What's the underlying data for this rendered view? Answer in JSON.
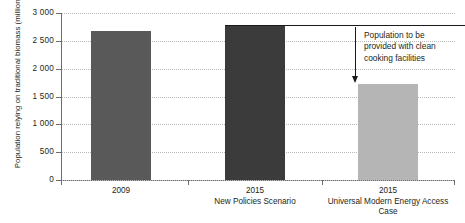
{
  "chart_data": {
    "type": "bar",
    "title": "",
    "xlabel": "",
    "ylabel": "Population relying on traditional biomass (million)",
    "ylim": [
      0,
      3000
    ],
    "grid": true,
    "legend": "none",
    "categories": [
      {
        "main": "2009",
        "sub": ""
      },
      {
        "main": "2015",
        "sub": "New Policies Scenario"
      },
      {
        "main": "2015",
        "sub": "Universal Modern Energy Access Case"
      }
    ],
    "values": [
      2670,
      2760,
      1720
    ],
    "bar_colors": [
      "#595959",
      "#3b3b3b",
      "#b5b5b5"
    ],
    "yticks": [
      "0",
      "500",
      "1 000",
      "1 500",
      "2 000",
      "2 500",
      "3 000"
    ],
    "ytick_values": [
      0,
      500,
      1000,
      1500,
      2000,
      2500,
      3000
    ],
    "annotations": [
      {
        "text_lines": [
          "Population to be",
          "provided with clean",
          "cooking facilities"
        ],
        "arrow_from_value": 2760,
        "arrow_to_value": 1720
      }
    ]
  },
  "colors": {
    "axis": "#6d6d6d",
    "grid": "#b9b9b9",
    "text": "#231f20",
    "annotation_rule": "#1a1a1a",
    "background": "#ffffff"
  }
}
